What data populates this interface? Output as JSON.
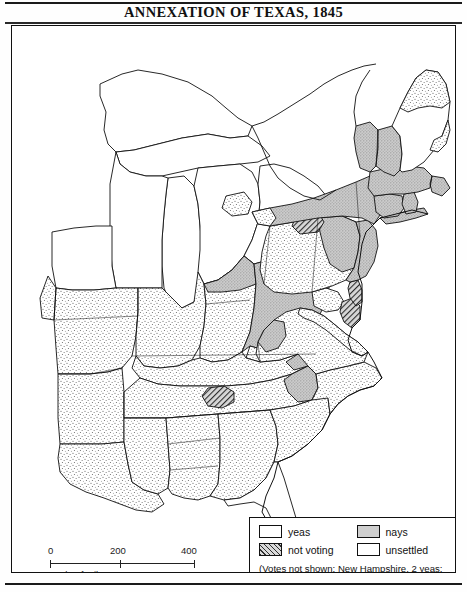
{
  "title": "ANNEXATION OF TEXAS, 1845",
  "scale": {
    "ticks": [
      "0",
      "200",
      "400"
    ],
    "label": "Scale of miles"
  },
  "legend": {
    "items": [
      {
        "key": "yeas",
        "label": "yeas",
        "pattern": "light-stipple",
        "color": "#ffffff"
      },
      {
        "key": "nays",
        "label": "nays",
        "pattern": "gray-stipple",
        "color": "#cfcfcf"
      },
      {
        "key": "not_voting",
        "label": "not voting",
        "pattern": "diagonal-hatch",
        "color": "#d9d9d9"
      },
      {
        "key": "unsettled",
        "label": "unsettled",
        "pattern": "none",
        "color": "#ffffff"
      }
    ],
    "note": "(Votes not shown: New Hampshire, 2 yeas; New York City, 2 yeas)"
  },
  "map_data": {
    "type": "choropleth",
    "subject": "U.S. House of Representatives vote on the annexation of Texas, 1845",
    "region": "Eastern United States",
    "categories": [
      "yeas",
      "nays",
      "not voting",
      "unsettled"
    ],
    "regions": [
      {
        "name": "Maine",
        "vote": "nays"
      },
      {
        "name": "Maine northern districts",
        "vote": "yeas"
      },
      {
        "name": "Vermont",
        "vote": "nays"
      },
      {
        "name": "New Hampshire",
        "vote": "nays"
      },
      {
        "name": "Massachusetts",
        "vote": "nays"
      },
      {
        "name": "Rhode Island",
        "vote": "nays"
      },
      {
        "name": "Connecticut",
        "vote": "nays"
      },
      {
        "name": "New York",
        "vote": "nays"
      },
      {
        "name": "New York western districts",
        "vote": "yeas"
      },
      {
        "name": "New Jersey",
        "vote": "nays"
      },
      {
        "name": "Pennsylvania",
        "vote": "yeas"
      },
      {
        "name": "Pennsylvania eastern districts",
        "vote": "nays"
      },
      {
        "name": "Pennsylvania northern district",
        "vote": "not voting"
      },
      {
        "name": "Delaware",
        "vote": "not voting"
      },
      {
        "name": "Maryland",
        "vote": "yeas"
      },
      {
        "name": "Maryland eastern district",
        "vote": "not voting"
      },
      {
        "name": "Virginia",
        "vote": "yeas"
      },
      {
        "name": "Virginia western district",
        "vote": "nays"
      },
      {
        "name": "North Carolina",
        "vote": "yeas"
      },
      {
        "name": "South Carolina",
        "vote": "yeas"
      },
      {
        "name": "Georgia",
        "vote": "yeas"
      },
      {
        "name": "Alabama",
        "vote": "yeas"
      },
      {
        "name": "Mississippi",
        "vote": "yeas"
      },
      {
        "name": "Louisiana",
        "vote": "yeas"
      },
      {
        "name": "Tennessee",
        "vote": "yeas"
      },
      {
        "name": "Tennessee eastern districts",
        "vote": "nays"
      },
      {
        "name": "Tennessee central district",
        "vote": "not voting"
      },
      {
        "name": "Kentucky",
        "vote": "yeas"
      },
      {
        "name": "Kentucky eastern district",
        "vote": "nays"
      },
      {
        "name": "Missouri",
        "vote": "yeas"
      },
      {
        "name": "Arkansas",
        "vote": "yeas"
      },
      {
        "name": "Illinois",
        "vote": "yeas"
      },
      {
        "name": "Indiana",
        "vote": "yeas"
      },
      {
        "name": "Indiana northern districts",
        "vote": "nays"
      },
      {
        "name": "Ohio",
        "vote": "nays"
      },
      {
        "name": "Ohio southern districts",
        "vote": "yeas"
      },
      {
        "name": "Ohio eastern district",
        "vote": "not voting"
      },
      {
        "name": "Michigan",
        "vote": "unsettled"
      },
      {
        "name": "Wisconsin Territory",
        "vote": "unsettled"
      },
      {
        "name": "Iowa Territory",
        "vote": "unsettled"
      },
      {
        "name": "Florida Territory",
        "vote": "unsettled"
      }
    ]
  }
}
